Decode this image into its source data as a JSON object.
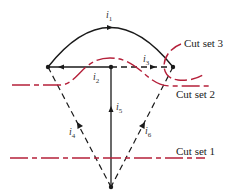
{
  "diagram": {
    "type": "graph-cut-sets",
    "colors": {
      "branch": "#1a1a1a",
      "cutset": "#b5203a"
    },
    "branches": [
      {
        "id": "i1",
        "label": "i",
        "sub": "1",
        "style": "solid",
        "kind": "arc-top"
      },
      {
        "id": "i2",
        "label": "i",
        "sub": "2",
        "style": "solid",
        "kind": "horizontal-left"
      },
      {
        "id": "i3",
        "label": "i",
        "sub": "3",
        "style": "dashed",
        "kind": "horizontal-right"
      },
      {
        "id": "i4",
        "label": "i",
        "sub": "4",
        "style": "dashed",
        "kind": "left-diagonal"
      },
      {
        "id": "i5",
        "label": "i",
        "sub": "5",
        "style": "solid",
        "kind": "vertical"
      },
      {
        "id": "i6",
        "label": "i",
        "sub": "6",
        "style": "dashed",
        "kind": "right-diagonal"
      }
    ],
    "cut_sets": [
      {
        "label": "Cut set 1"
      },
      {
        "label": "Cut set 2"
      },
      {
        "label": "Cut set 3"
      }
    ]
  }
}
